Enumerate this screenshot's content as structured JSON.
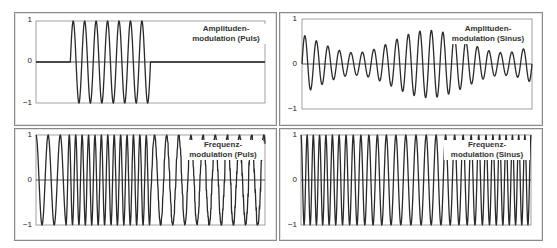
{
  "chart_data": [
    {
      "type": "line",
      "title": "Amplitudenmodulation (Puls)",
      "label_lines": [
        "Amplituden-",
        "modulation (Puls)"
      ],
      "ylim": [
        -1,
        1
      ],
      "yticks": [
        "1",
        "0",
        "−1"
      ],
      "grid": false,
      "legend": "none",
      "signal": "am-pulse",
      "description": "Carrier zero until ~15% of width, then 7 full cycles at amplitude 1 (pulse on), then zero to the end",
      "carrier_cycles_in_pulse": 7,
      "pulse_start_frac": 0.15,
      "pulse_end_frac": 0.5
    },
    {
      "type": "line",
      "title": "Amplitudenmodulation (Sinus)",
      "label_lines": [
        "Amplituden-",
        "modulation (Sinus)"
      ],
      "ylim": [
        -1,
        1
      ],
      "yticks": [
        "1",
        "0",
        "−1"
      ],
      "grid": false,
      "legend": "none",
      "signal": "am-sine",
      "description": "Sinusoidal carrier (~20 cycles) whose amplitude varies sinusoidally between ~0.25 and ~0.75",
      "carrier_cycles": 20,
      "envelope_cycles": 1.55,
      "envelope_mean": 0.5,
      "envelope_depth": 0.25
    },
    {
      "type": "line",
      "title": "Frequenzmodulation (Puls)",
      "label_lines": [
        "Frequenz-",
        "modulation (Puls)"
      ],
      "ylim": [
        -1,
        1
      ],
      "yticks": [
        "1",
        "0",
        "−1"
      ],
      "grid": false,
      "legend": "none",
      "signal": "fm-pulse",
      "description": "Constant amplitude 1; low frequency for first ~3 cycles, switches to about double frequency, then back to low frequency after ~50% of width",
      "low_period_frac": 0.053,
      "high_period_frac": 0.028,
      "high_start_frac": 0.13,
      "high_end_frac": 0.5
    },
    {
      "type": "line",
      "title": "Frequenzmodulation (Sinus)",
      "label_lines": [
        "Frequenz-",
        "modulation (Sinus)"
      ],
      "ylim": [
        -1,
        1
      ],
      "yticks": [
        "1",
        "0",
        "−1"
      ],
      "grid": false,
      "legend": "none",
      "signal": "fm-sine",
      "description": "Constant amplitude 1; frequency varies smoothly (sinusoidally) across the width",
      "mean_cycles": 30,
      "freq_deviation": 0.25,
      "mod_cycles": 1
    }
  ],
  "panels": [
    {
      "title_line1": "Amplituden-",
      "title_line2": "modulation (Puls)",
      "y_top": "1",
      "y_mid": "0",
      "y_bot": "−1"
    },
    {
      "title_line1": "Amplituden-",
      "title_line2": "modulation (Sinus)",
      "y_top": "1",
      "y_mid": "0",
      "y_bot": "−1"
    },
    {
      "title_line1": "Frequenz-",
      "title_line2": "modulation (Puls)",
      "y_top": "1",
      "y_mid": "0",
      "y_bot": "−1"
    },
    {
      "title_line1": "Frequenz-",
      "title_line2": "modulation (Sinus)",
      "y_top": "1",
      "y_mid": "0",
      "y_bot": "−1"
    }
  ],
  "colors": {
    "line": "#2a2a2a",
    "axis": "#555555",
    "frame": "#8a8a8a"
  }
}
